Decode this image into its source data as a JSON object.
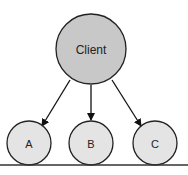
{
  "diagram": {
    "root": {
      "label": "Client",
      "fill": "#c8c8c8"
    },
    "children": [
      {
        "label": "A",
        "fill": "#e4e4e4"
      },
      {
        "label": "B",
        "fill": "#e4e4e4"
      },
      {
        "label": "C",
        "fill": "#e4e4e4"
      }
    ],
    "edges": [
      {
        "from": "Client",
        "to": "A"
      },
      {
        "from": "Client",
        "to": "B"
      },
      {
        "from": "Client",
        "to": "C"
      }
    ]
  }
}
